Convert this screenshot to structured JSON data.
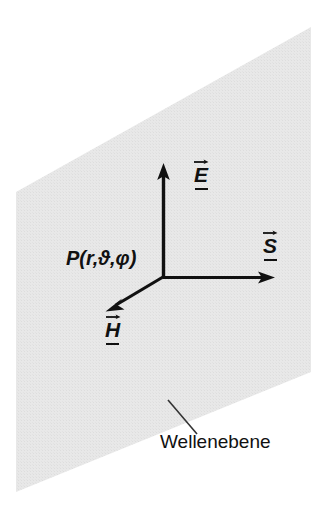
{
  "figure": {
    "title_caption": "Wellenebene",
    "plane_label": "Wellenebene",
    "point_label": "P(r,ϑ,φ)",
    "colors": {
      "plane_fill": "#e6e6e6",
      "stroke": "#111111",
      "background": "#ffffff"
    },
    "vectors": [
      {
        "name": "electric-field",
        "glyph": "E",
        "label": "E",
        "direction": "up",
        "accent": "arrow",
        "underline": true
      },
      {
        "name": "poynting-vector",
        "glyph": "S",
        "label": "S",
        "direction": "right",
        "accent": "arrow",
        "underline": true
      },
      {
        "name": "magnetic-field",
        "glyph": "H",
        "label": "H",
        "direction": "down-left",
        "accent": "arrow",
        "underline": true
      }
    ],
    "geometry": {
      "plane_polygon": "311,27 311,372 16,492 16,192",
      "origin": "163,277",
      "e_tip": "163,166",
      "s_tip": "274,277",
      "h_tip": "107,310",
      "leader_from": "168,400",
      "leader_to": "197,434"
    }
  }
}
